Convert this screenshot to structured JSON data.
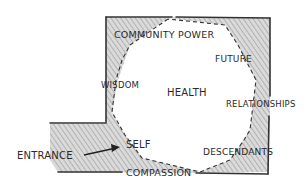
{
  "diagram": {
    "type": "hand-drawn floor plan sketch",
    "colors": {
      "ink": "#2a2a2a",
      "wall_shading": "#9a9a9a",
      "background": "#ffffff"
    },
    "labels": {
      "community_power": "COMMUNITY POWER",
      "future": "FUTURE",
      "wisdom": "WISDOM",
      "health": "HEALTH",
      "relationships": "RELATIONSHIPS",
      "self": "SELF",
      "entrance": "ENTRANCE",
      "descendants": "DESCENDANTS",
      "compassion": "COMPASSION"
    },
    "arrow": {
      "from": "entrance",
      "to": "self"
    }
  }
}
